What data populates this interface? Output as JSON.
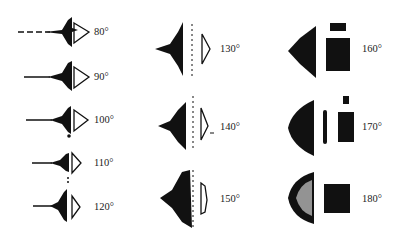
{
  "figure": {
    "panels": [
      {
        "angle_label": "80°",
        "x": 120,
        "y": 33
      },
      {
        "angle_label": "90°",
        "x": 120,
        "y": 77
      },
      {
        "angle_label": "100°",
        "x": 120,
        "y": 119
      },
      {
        "angle_label": "110°",
        "x": 120,
        "y": 162
      },
      {
        "angle_label": "120°",
        "x": 120,
        "y": 207
      },
      {
        "angle_label": "130°",
        "x": 220,
        "y": 47
      },
      {
        "angle_label": "140°",
        "x": 220,
        "y": 126
      },
      {
        "angle_label": "150°",
        "x": 220,
        "y": 198
      },
      {
        "angle_label": "160°",
        "x": 362,
        "y": 48
      },
      {
        "angle_label": "170°",
        "x": 362,
        "y": 126
      },
      {
        "angle_label": "180°",
        "x": 362,
        "y": 198
      }
    ]
  }
}
